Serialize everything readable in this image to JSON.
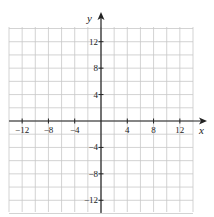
{
  "chart_data": {
    "type": "scatter",
    "title": "",
    "xlabel": "x",
    "ylabel": "y",
    "xlim": [
      -14,
      14
    ],
    "ylim": [
      -14,
      14
    ],
    "grid": true,
    "grid_step": 2,
    "x_ticks": [
      -12,
      -8,
      -4,
      4,
      8,
      12
    ],
    "y_ticks": [
      12,
      8,
      4,
      -4,
      -8,
      -12
    ],
    "x_tick_labels": [
      "−12",
      "−8",
      "−4",
      "4",
      "8",
      "12"
    ],
    "y_tick_labels": [
      "12",
      "8",
      "4",
      "−4",
      "−8",
      "−12"
    ],
    "series": [],
    "legend": null
  },
  "colors": {
    "grid": "#c8c8c8",
    "axis": "#222222",
    "background": "#ffffff"
  }
}
